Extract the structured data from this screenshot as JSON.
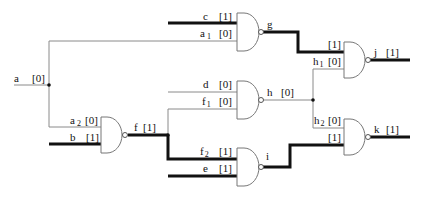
{
  "diagram": {
    "type": "logic-circuit",
    "colors": {
      "logic1_wire": "#111111",
      "logic0_wire": "#8a8a8a"
    },
    "gates": [
      {
        "id": "g",
        "kind": "NAND",
        "inputs": [
          "c",
          "a1"
        ],
        "output": "g"
      },
      {
        "id": "f",
        "kind": "NAND",
        "inputs": [
          "a2",
          "b"
        ],
        "output": "f"
      },
      {
        "id": "h",
        "kind": "NAND",
        "inputs": [
          "d",
          "f1"
        ],
        "output": "h"
      },
      {
        "id": "i",
        "kind": "NAND",
        "inputs": [
          "f2",
          "e"
        ],
        "output": "i"
      },
      {
        "id": "j",
        "kind": "NAND",
        "inputs": [
          "g",
          "h1"
        ],
        "output": "j"
      },
      {
        "id": "k",
        "kind": "NAND",
        "inputs": [
          "h2",
          "i"
        ],
        "output": "k"
      }
    ],
    "labels": {
      "a": "a",
      "a_val": "[0]",
      "b": "b",
      "b_val": "[1]",
      "c": "c",
      "c_val": "[1]",
      "a1": "a",
      "a1_sub": "1",
      "a1_val": "[0]",
      "a2": "a",
      "a2_sub": "2",
      "a2_val": "[0]",
      "d": "d",
      "d_val": "[0]",
      "e": "e",
      "e_val": "[1]",
      "f": "f",
      "f_val": "[1]",
      "f1": "f",
      "f1_sub": "1",
      "f1_val": "[0]",
      "f2": "f",
      "f2_sub": "2",
      "f2_val": "[1]",
      "g": "g",
      "g_in_val": "[1]",
      "h": "h",
      "h_val": "[0]",
      "h1": "h",
      "h1_sub": "1",
      "h1_val": "[0]",
      "h2": "h",
      "h2_sub": "2",
      "h2_val": "[0]",
      "i": "i",
      "i_in_val": "[1]",
      "j": "j",
      "j_val": "[1]",
      "k": "k",
      "k_val": "[1]"
    }
  }
}
